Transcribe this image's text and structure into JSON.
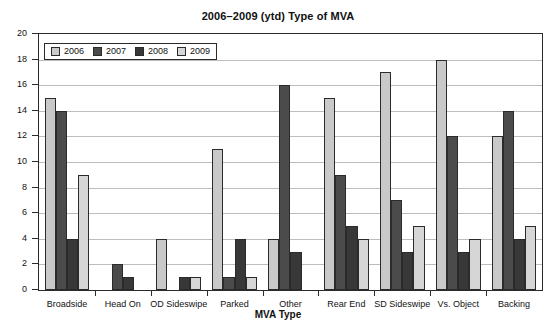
{
  "chart_data": {
    "type": "bar",
    "title": "2006–2009 (ytd) Type of MVA",
    "xlabel": "MVA Type",
    "ylabel": "",
    "ylim": [
      0,
      20
    ],
    "ytick_step": 2,
    "grid": true,
    "legend_position": "top-left-inside",
    "categories": [
      "Broadside",
      "Head On",
      "OD Sideswipe",
      "Parked",
      "Other",
      "Rear End",
      "SD Sideswipe",
      "Vs. Object",
      "Backing"
    ],
    "yticks": [
      0,
      2,
      4,
      6,
      8,
      10,
      12,
      14,
      16,
      18,
      20
    ],
    "series": [
      {
        "name": "2006",
        "color": "#c9c9c9",
        "values": [
          15,
          0,
          4,
          11,
          4,
          15,
          17,
          18,
          12
        ]
      },
      {
        "name": "2007",
        "color": "#4b4b4b",
        "values": [
          14,
          2,
          0,
          1,
          16,
          9,
          7,
          12,
          14
        ]
      },
      {
        "name": "2008",
        "color": "#383838",
        "values": [
          4,
          1,
          1,
          4,
          3,
          5,
          3,
          3,
          4
        ]
      },
      {
        "name": "2009",
        "color": "#d6d6d6",
        "values": [
          9,
          0,
          1,
          1,
          0,
          4,
          5,
          4,
          5
        ]
      }
    ]
  },
  "axis_colors": {
    "frame": "#2b2b2b",
    "grid": "#bdbdbd",
    "text": "#111111"
  }
}
